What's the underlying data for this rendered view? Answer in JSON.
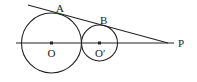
{
  "diagram": {
    "type": "geometry",
    "labels": {
      "A": "A",
      "B": "B",
      "O": "O",
      "O_prime": "O′",
      "P": "P"
    },
    "colors": {
      "stroke": "#222222",
      "background": "#ffffff"
    },
    "circles": [
      {
        "name": "circle-O",
        "center": "O",
        "cx": 51.5,
        "cy": 43,
        "r": 30,
        "tangent_point": "A"
      },
      {
        "name": "circle-O-prime",
        "center": "O′",
        "cx": 99.5,
        "cy": 43,
        "r": 18,
        "tangent_point": "B"
      }
    ],
    "lines": [
      {
        "name": "center-line",
        "from": [
          16,
          43
        ],
        "to": [
          174,
          43
        ]
      },
      {
        "name": "tangent-line",
        "from": [
          28,
          5
        ],
        "to": [
          168,
          43
        ]
      }
    ]
  }
}
